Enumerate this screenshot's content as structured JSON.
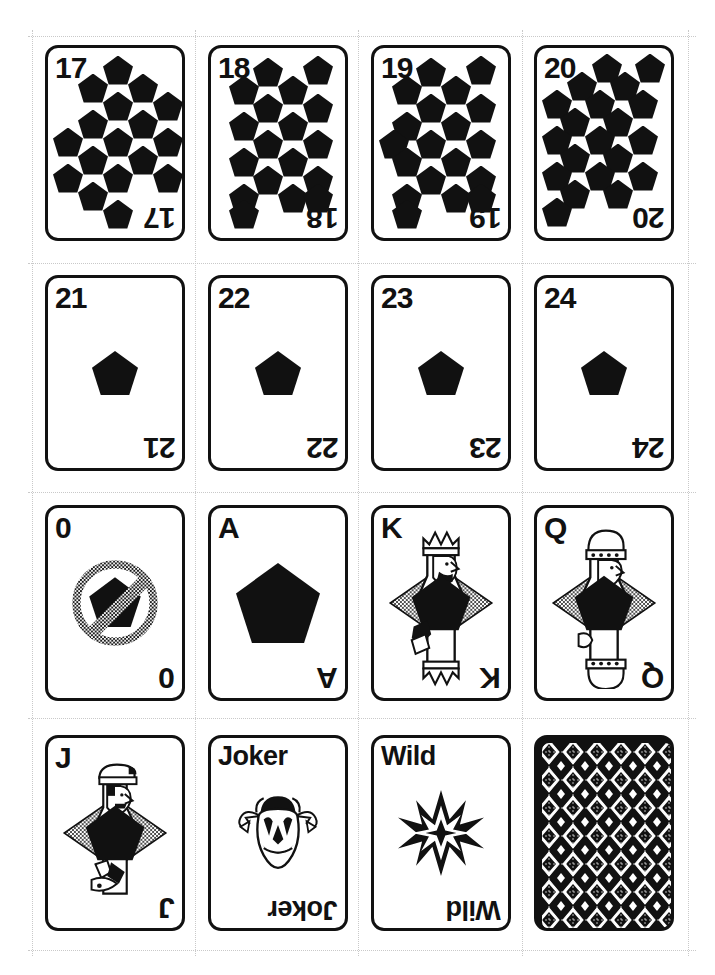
{
  "document": {
    "title": "Printable Pentagon Card Deck Sheet",
    "sheet_label": "card sheet page",
    "grid": {
      "columns": 4,
      "rows": 4
    },
    "colors": {
      "ink": "#111111",
      "paper": "#ffffff",
      "cut_guide": "#c9c9c9",
      "halftone": "#8a8a8a"
    }
  },
  "cards": [
    {
      "index": "17",
      "corner_top": "17",
      "corner_bottom": "17",
      "art": "pips",
      "pip_count": 17,
      "pip_symbol": "pentagon"
    },
    {
      "index": "18",
      "corner_top": "18",
      "corner_bottom": "18",
      "art": "pips",
      "pip_count": 18,
      "pip_symbol": "pentagon"
    },
    {
      "index": "19",
      "corner_top": "19",
      "corner_bottom": "19",
      "art": "pips",
      "pip_count": 19,
      "pip_symbol": "pentagon"
    },
    {
      "index": "20",
      "corner_top": "20",
      "corner_bottom": "20",
      "art": "pips",
      "pip_count": 20,
      "pip_symbol": "pentagon"
    },
    {
      "index": "21",
      "corner_top": "21",
      "corner_bottom": "21",
      "art": "single-pip",
      "pip_count": 1,
      "pip_symbol": "pentagon"
    },
    {
      "index": "22",
      "corner_top": "22",
      "corner_bottom": "22",
      "art": "single-pip",
      "pip_count": 1,
      "pip_symbol": "pentagon"
    },
    {
      "index": "23",
      "corner_top": "23",
      "corner_bottom": "23",
      "art": "single-pip",
      "pip_count": 1,
      "pip_symbol": "pentagon"
    },
    {
      "index": "24",
      "corner_top": "24",
      "corner_bottom": "24",
      "art": "single-pip",
      "pip_count": 1,
      "pip_symbol": "pentagon"
    },
    {
      "index": "0",
      "corner_top": "0",
      "corner_bottom": "0",
      "art": "no-pentagon-sign",
      "pip_count": 0,
      "pip_symbol": "pentagon-crossed-out"
    },
    {
      "index": "A",
      "corner_top": "A",
      "corner_bottom": "A",
      "art": "ace-pip",
      "pip_count": 1,
      "pip_symbol": "pentagon"
    },
    {
      "index": "K",
      "corner_top": "K",
      "corner_bottom": "K",
      "art": "king",
      "pip_count": 1,
      "pip_symbol": "pentagon"
    },
    {
      "index": "Q",
      "corner_top": "Q",
      "corner_bottom": "Q",
      "art": "queen",
      "pip_count": 1,
      "pip_symbol": "pentagon"
    },
    {
      "index": "J",
      "corner_top": "J",
      "corner_bottom": "J",
      "art": "jack",
      "pip_count": 1,
      "pip_symbol": "pentagon"
    },
    {
      "index": "Joker",
      "corner_top": "Joker",
      "corner_bottom": "Joker",
      "art": "joker-face",
      "pip_count": 0,
      "pip_symbol": "jester"
    },
    {
      "index": "Wild",
      "corner_top": "Wild",
      "corner_bottom": "Wild",
      "art": "wild-star",
      "pip_count": 0,
      "pip_symbol": "eight-point-star"
    },
    {
      "index": "back",
      "corner_top": "",
      "corner_bottom": "",
      "art": "card-back",
      "pip_count": 0,
      "pip_symbol": "diamond-lattice"
    }
  ],
  "pip_layouts": {
    "c17": [
      [
        70,
        22
      ],
      [
        45,
        40
      ],
      [
        95,
        40
      ],
      [
        70,
        58
      ],
      [
        120,
        58
      ],
      [
        45,
        76
      ],
      [
        95,
        76
      ],
      [
        20,
        94
      ],
      [
        70,
        94
      ],
      [
        120,
        94
      ],
      [
        45,
        112
      ],
      [
        95,
        112
      ],
      [
        20,
        130
      ],
      [
        70,
        130
      ],
      [
        120,
        130
      ],
      [
        45,
        148
      ],
      [
        70,
        166
      ]
    ],
    "c18": [
      [
        57,
        24
      ],
      [
        107,
        22
      ],
      [
        33,
        42
      ],
      [
        82,
        42
      ],
      [
        57,
        60
      ],
      [
        107,
        60
      ],
      [
        33,
        78
      ],
      [
        82,
        78
      ],
      [
        107,
        96
      ],
      [
        57,
        96
      ],
      [
        33,
        114
      ],
      [
        82,
        114
      ],
      [
        57,
        132
      ],
      [
        107,
        132
      ],
      [
        33,
        150
      ],
      [
        82,
        150
      ],
      [
        107,
        150
      ],
      [
        33,
        166
      ]
    ],
    "c19": [
      [
        57,
        24
      ],
      [
        107,
        22
      ],
      [
        33,
        42
      ],
      [
        82,
        42
      ],
      [
        57,
        60
      ],
      [
        107,
        60
      ],
      [
        33,
        78
      ],
      [
        82,
        78
      ],
      [
        107,
        96
      ],
      [
        57,
        96
      ],
      [
        20,
        96
      ],
      [
        33,
        114
      ],
      [
        82,
        114
      ],
      [
        57,
        132
      ],
      [
        107,
        132
      ],
      [
        33,
        150
      ],
      [
        82,
        150
      ],
      [
        107,
        150
      ],
      [
        33,
        166
      ]
    ],
    "c20": [
      [
        70,
        20
      ],
      [
        113,
        20
      ],
      [
        45,
        38
      ],
      [
        88,
        38
      ],
      [
        20,
        56
      ],
      [
        63,
        56
      ],
      [
        106,
        56
      ],
      [
        38,
        74
      ],
      [
        81,
        74
      ],
      [
        20,
        92
      ],
      [
        63,
        92
      ],
      [
        106,
        92
      ],
      [
        38,
        110
      ],
      [
        81,
        110
      ],
      [
        20,
        128
      ],
      [
        63,
        128
      ],
      [
        106,
        128
      ],
      [
        38,
        146
      ],
      [
        81,
        146
      ],
      [
        20,
        164
      ]
    ]
  },
  "cut_guides": {
    "horizontal_y": [
      36,
      263,
      492,
      718,
      950
    ],
    "vertical_x": [
      32,
      195,
      358,
      522,
      688
    ],
    "label": "dotted trim guide"
  }
}
